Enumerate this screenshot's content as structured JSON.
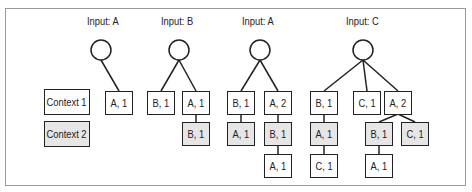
{
  "legend": [
    {
      "label": "Context 1",
      "fill": "#ffffff"
    },
    {
      "label": "Context 2",
      "fill": "#e6e6e6"
    }
  ],
  "trees": [
    {
      "title": "Input: A",
      "root": {
        "cx": 101,
        "cy": 50
      },
      "nodes": [
        {
          "label": "A, 1",
          "x": 105,
          "y": 91,
          "ctx": 1
        }
      ],
      "edges": [
        [
          101,
          60,
          119,
          91
        ]
      ]
    },
    {
      "title": "Input: B",
      "root": {
        "cx": 179,
        "cy": 50
      },
      "nodes": [
        {
          "label": "B, 1",
          "x": 147,
          "y": 91,
          "ctx": 1
        },
        {
          "label": "A, 1",
          "x": 182,
          "y": 91,
          "ctx": 1
        },
        {
          "label": "B, 1",
          "x": 182,
          "y": 122,
          "ctx": 2
        }
      ],
      "edges": [
        [
          179,
          60,
          161,
          91
        ],
        [
          179,
          60,
          196,
          91
        ],
        [
          196,
          114,
          196,
          122
        ]
      ]
    },
    {
      "title": "Input: A",
      "root": {
        "cx": 260,
        "cy": 50
      },
      "nodes": [
        {
          "label": "B, 1",
          "x": 227,
          "y": 91,
          "ctx": 1
        },
        {
          "label": "A, 2",
          "x": 264,
          "y": 91,
          "ctx": 1
        },
        {
          "label": "A, 1",
          "x": 227,
          "y": 122,
          "ctx": 2
        },
        {
          "label": "B, 1",
          "x": 264,
          "y": 122,
          "ctx": 2
        },
        {
          "label": "A, 1",
          "x": 264,
          "y": 154,
          "ctx": 1
        }
      ],
      "edges": [
        [
          260,
          60,
          241,
          91
        ],
        [
          260,
          60,
          278,
          91
        ],
        [
          241,
          114,
          241,
          122
        ],
        [
          278,
          114,
          278,
          122
        ],
        [
          278,
          146,
          278,
          154
        ]
      ]
    },
    {
      "title": "Input: C",
      "root": {
        "cx": 363,
        "cy": 50
      },
      "nodes": [
        {
          "label": "B, 1",
          "x": 310,
          "y": 91,
          "ctx": 1
        },
        {
          "label": "C, 1",
          "x": 353,
          "y": 91,
          "ctx": 1
        },
        {
          "label": "A, 2",
          "x": 384,
          "y": 91,
          "ctx": 1
        },
        {
          "label": "A, 1",
          "x": 310,
          "y": 122,
          "ctx": 2
        },
        {
          "label": "B, 1",
          "x": 365,
          "y": 122,
          "ctx": 2
        },
        {
          "label": "C, 1",
          "x": 401,
          "y": 122,
          "ctx": 2
        },
        {
          "label": "C, 1",
          "x": 310,
          "y": 154,
          "ctx": 1
        },
        {
          "label": "A, 1",
          "x": 365,
          "y": 154,
          "ctx": 1
        }
      ],
      "edges": [
        [
          363,
          60,
          324,
          91
        ],
        [
          363,
          60,
          367,
          91
        ],
        [
          363,
          60,
          398,
          91
        ],
        [
          324,
          114,
          324,
          122
        ],
        [
          324,
          146,
          324,
          154
        ],
        [
          398,
          114,
          379,
          122
        ],
        [
          398,
          114,
          415,
          122
        ],
        [
          379,
          146,
          379,
          154
        ]
      ]
    }
  ],
  "title_positions": [
    [
      87,
      15
    ],
    [
      161,
      15
    ],
    [
      242,
      15
    ],
    [
      346,
      15
    ]
  ]
}
